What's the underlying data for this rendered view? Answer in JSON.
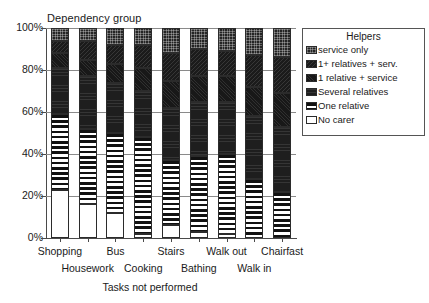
{
  "chart_data": {
    "type": "bar",
    "subtype": "stacked-100-percent",
    "title": "Dependency group",
    "xlabel": "Tasks not performed",
    "ylabel": "",
    "ylim": [
      0,
      100
    ],
    "ytick_labels": [
      "0%",
      "20%",
      "40%",
      "60%",
      "80%",
      "100%"
    ],
    "ytick_values": [
      0,
      20,
      40,
      60,
      80,
      100
    ],
    "grid": true,
    "legend_position": "right",
    "legend_title": "Helpers",
    "categories": [
      "Shopping",
      "Housework",
      "Bus",
      "Cooking",
      "Stairs",
      "Bathing",
      "Walk out",
      "Walk in",
      "Chairfast"
    ],
    "series": [
      {
        "name": "No carer",
        "pattern": "white",
        "values": [
          23,
          16,
          12,
          2,
          6,
          3,
          2,
          0,
          0
        ]
      },
      {
        "name": "One relative",
        "pattern": "h-stripes",
        "values": [
          36,
          36,
          38,
          46,
          31,
          36,
          38,
          28,
          22
        ]
      },
      {
        "name": "Several relatives",
        "pattern": "solid-dark",
        "values": [
          22,
          25,
          24,
          22,
          25,
          26,
          25,
          30,
          31
        ]
      },
      {
        "name": "1 relative + service",
        "pattern": "dark-speckle",
        "values": [
          7,
          8,
          9,
          11,
          13,
          12,
          12,
          14,
          16
        ]
      },
      {
        "name": "1+ relatives + serv.",
        "pattern": "dark-mottle",
        "values": [
          6,
          9,
          9,
          11,
          13,
          13,
          12,
          15,
          17
        ]
      },
      {
        "name": "service only",
        "pattern": "checker",
        "values": [
          6,
          6,
          8,
          8,
          12,
          10,
          11,
          13,
          14
        ]
      }
    ]
  },
  "legend": {
    "title": "Helpers",
    "items": [
      {
        "label": "service only"
      },
      {
        "label": "1+ relatives + serv."
      },
      {
        "label": "1 relative + service"
      },
      {
        "label": "Several relatives"
      },
      {
        "label": "One relative"
      },
      {
        "label": "No carer"
      }
    ]
  },
  "axes": {
    "plot_title": "Dependency group",
    "x_title": "Tasks not performed",
    "y_ticks": [
      "100%",
      "80%",
      "60%",
      "40%",
      "20%",
      "0%"
    ],
    "x_categories": [
      "Shopping",
      "Housework",
      "Bus",
      "Cooking",
      "Stairs",
      "Bathing",
      "Walk out",
      "Walk in",
      "Chairfast"
    ]
  },
  "colors": {
    "axis": "#4a4a4a",
    "grid": "#8a8a8a",
    "bar_outline": "#2b2b2b",
    "dark_fill": "#1e1e1e",
    "light_fill": "#ffffff",
    "legend_border": "#555555"
  }
}
